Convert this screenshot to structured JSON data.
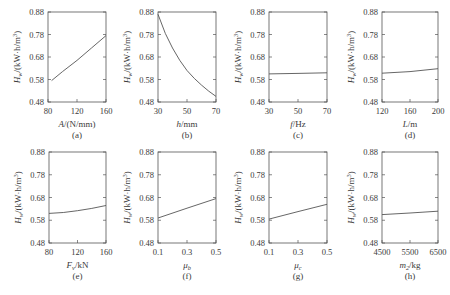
{
  "chart_data": [
    {
      "id": "a",
      "type": "line",
      "panel_label": "(a)",
      "xlabel": "A/(N/mm)",
      "ylabel": "H_w/(kW·h/m³)",
      "xlim": [
        80,
        160
      ],
      "xticks": [
        80,
        120,
        160
      ],
      "ylim": [
        0.48,
        0.88
      ],
      "yticks": [
        "0.48",
        "0.58",
        "0.68",
        "0.78",
        "0.88"
      ],
      "x": [
        85,
        100,
        120,
        140,
        160
      ],
      "values": [
        0.575,
        0.615,
        0.665,
        0.72,
        0.775
      ]
    },
    {
      "id": "b",
      "type": "line",
      "panel_label": "(b)",
      "xlabel": "h/mm",
      "ylabel": "H_w/(kW·h/m³)",
      "xlim": [
        30,
        70
      ],
      "xticks": [
        30,
        50,
        70
      ],
      "ylim": [
        0.48,
        0.88
      ],
      "yticks": [
        "0.48",
        "0.58",
        "0.68",
        "0.78",
        "0.88"
      ],
      "x": [
        30,
        35,
        40,
        45,
        50,
        55,
        60,
        65,
        70
      ],
      "values": [
        0.87,
        0.785,
        0.72,
        0.665,
        0.62,
        0.585,
        0.555,
        0.528,
        0.505
      ]
    },
    {
      "id": "c",
      "type": "line",
      "panel_label": "(c)",
      "xlabel": "f/Hz",
      "ylabel": "H_w/(kW·h/m³)",
      "xlim": [
        30,
        70
      ],
      "xticks": [
        30,
        50,
        70
      ],
      "ylim": [
        0.48,
        0.88
      ],
      "yticks": [
        "0.48",
        "0.58",
        "0.68",
        "0.78",
        "0.88"
      ],
      "x": [
        30,
        50,
        70
      ],
      "values": [
        0.605,
        0.607,
        0.61
      ]
    },
    {
      "id": "d",
      "type": "line",
      "panel_label": "(d)",
      "xlabel": "L/m",
      "ylabel": "H_w/(kW·h/m³)",
      "xlim": [
        120,
        200
      ],
      "xticks": [
        120,
        160,
        200
      ],
      "ylim": [
        0.48,
        0.88
      ],
      "yticks": [
        "0.48",
        "0.58",
        "0.68",
        "0.78",
        "0.88"
      ],
      "x": [
        120,
        160,
        200
      ],
      "values": [
        0.608,
        0.615,
        0.628
      ]
    },
    {
      "id": "e",
      "type": "line",
      "panel_label": "(e)",
      "xlabel": "F_v/kN",
      "ylabel": "H_w/(kW·h/m³)",
      "xlim": [
        80,
        160
      ],
      "xticks": [
        80,
        120,
        160
      ],
      "ylim": [
        0.48,
        0.88
      ],
      "yticks": [
        "0.48",
        "0.58",
        "0.68",
        "0.78",
        "0.88"
      ],
      "x": [
        80,
        100,
        120,
        140,
        160
      ],
      "values": [
        0.61,
        0.614,
        0.622,
        0.632,
        0.645
      ]
    },
    {
      "id": "f",
      "type": "line",
      "panel_label": "(f)",
      "xlabel": "μ_b",
      "ylabel": "H_w/(kW·h/m³)",
      "xlim": [
        0.1,
        0.5
      ],
      "xticks": [
        0.1,
        0.3,
        0.5
      ],
      "ylim": [
        0.48,
        0.88
      ],
      "yticks": [
        "0.48",
        "0.58",
        "0.68",
        "0.78",
        "0.88"
      ],
      "x": [
        0.1,
        0.3,
        0.5
      ],
      "values": [
        0.59,
        0.633,
        0.675
      ]
    },
    {
      "id": "g",
      "type": "line",
      "panel_label": "(g)",
      "xlabel": "μ_c",
      "ylabel": "H_w/(kW·h/m³)",
      "xlim": [
        0.1,
        0.5
      ],
      "xticks": [
        0.1,
        0.3,
        0.5
      ],
      "ylim": [
        0.48,
        0.88
      ],
      "yticks": [
        "0.48",
        "0.58",
        "0.68",
        "0.78",
        "0.88"
      ],
      "x": [
        0.1,
        0.3,
        0.5
      ],
      "values": [
        0.585,
        0.618,
        0.65
      ]
    },
    {
      "id": "h",
      "type": "line",
      "panel_label": "(h)",
      "xlabel": "m_2/kg",
      "ylabel": "H_w/(kW·h/m³)",
      "xlim": [
        4500,
        6500
      ],
      "xticks": [
        4500,
        5500,
        6500
      ],
      "ylim": [
        0.48,
        0.88
      ],
      "yticks": [
        "0.48",
        "0.58",
        "0.68",
        "0.78",
        "0.88"
      ],
      "x": [
        4500,
        5500,
        6500
      ],
      "values": [
        0.605,
        0.612,
        0.62
      ]
    }
  ],
  "figure": {
    "grid": false,
    "line_color": "#555555",
    "axis_color": "#555555",
    "caption_color": "#c8c8c8"
  }
}
